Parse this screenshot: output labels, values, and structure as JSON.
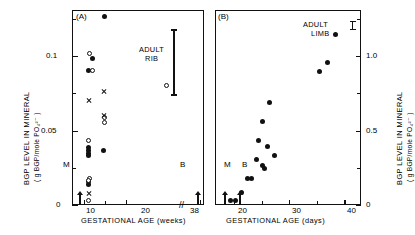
{
  "figure": {
    "panels": [
      {
        "id": "(A)",
        "xlabel": "GESTATIONAL  AGE  (weeks)",
        "ylabel_main": "BGP LEVEL IN MINERAL",
        "ylabel_units": "( g BGP/mole PO₄²⁻ )",
        "annotation": "ADULT\nRIB",
        "annotation_line1": "ADULT",
        "annotation_line2": "RIB",
        "marker_m": "M",
        "marker_b": "B",
        "xticklabels": [
          "10",
          "20",
          "38"
        ],
        "yticklabels": [
          "0",
          "0.05",
          "0.1"
        ],
        "axis_break": "//"
      },
      {
        "id": "(B)",
        "xlabel": "GESTATIONAL  AGE  (days)",
        "ylabel_main": "BGP LEVEL IN MINERAL",
        "ylabel_units": "( g BGP/mole PO₄²⁻ )",
        "annotation_line1": "ADULT",
        "annotation_line2": "LIMB",
        "marker_m": "M",
        "marker_b": "B",
        "xticklabels": [
          "20",
          "30",
          "40"
        ],
        "yticklabels": [
          "0",
          "0.5",
          "1.0"
        ]
      }
    ],
    "caption": ""
  },
  "chart_data": [
    {
      "type": "scatter",
      "panel": "(A)",
      "title": "(A)",
      "xlabel": "GESTATIONAL AGE (weeks)",
      "ylabel": "BGP LEVEL IN MINERAL (g BGP/mole PO4 2-)",
      "xlim": [
        7,
        39
      ],
      "ylim": [
        0,
        0.131
      ],
      "xticks": [
        10,
        20,
        38
      ],
      "yticks": [
        0,
        0.05,
        0.1
      ],
      "yminorticks": [
        0.025,
        0.075,
        0.125
      ],
      "grid": false,
      "legend": null,
      "axis_break_between": [
        22,
        36
      ],
      "series": [
        {
          "name": "filled-circle",
          "marker": "filled circle",
          "points": [
            {
              "x": 11.0,
              "y": 0.0905
            },
            {
              "x": 14.8,
              "y": 0.1265
            },
            {
              "x": 11.9,
              "y": 0.0985
            },
            {
              "x": 14.7,
              "y": 0.0365
            },
            {
              "x": 11.0,
              "y": 0.0385
            },
            {
              "x": 11.0,
              "y": 0.0365
            },
            {
              "x": 11.0,
              "y": 0.0345
            },
            {
              "x": 10.9,
              "y": 0.033
            },
            {
              "x": 11.0,
              "y": 0.0155
            },
            {
              "x": 11.1,
              "y": 0.014
            }
          ]
        },
        {
          "name": "open-circle",
          "marker": "open circle",
          "points": [
            {
              "x": 11.2,
              "y": 0.1015
            },
            {
              "x": 12.0,
              "y": 0.0905
            },
            {
              "x": 14.8,
              "y": 0.0585
            },
            {
              "x": 14.8,
              "y": 0.0555
            },
            {
              "x": 10.9,
              "y": 0.0435
            },
            {
              "x": 11.2,
              "y": 0.018
            },
            {
              "x": 11.0,
              "y": 0.0165
            },
            {
              "x": 11.0,
              "y": 0.003
            },
            {
              "x": 30.0,
              "y": 0.08
            }
          ]
        },
        {
          "name": "cross",
          "marker": "x",
          "points": [
            {
              "x": 11.0,
              "y": 0.07
            },
            {
              "x": 14.8,
              "y": 0.076
            },
            {
              "x": 14.8,
              "y": 0.06
            },
            {
              "x": 11.0,
              "y": 0.0075
            }
          ]
        }
      ],
      "range_bars": [
        {
          "label": "ADULT RIB",
          "x": 31.6,
          "ymin": 0.0735,
          "ymax": 0.118
        }
      ],
      "axis_arrows": [
        {
          "label": "M",
          "x": 8.6,
          "y": 0.0
        },
        {
          "label": "B",
          "x": 37.2,
          "y": 0.0
        }
      ]
    },
    {
      "type": "scatter",
      "panel": "(B)",
      "title": "(B)",
      "xlabel": "GESTATIONAL AGE (days)",
      "ylabel": "BGP LEVEL IN MINERAL (g BGP/mole PO4 2-)",
      "xlim": [
        16.5,
        43
      ],
      "ylim": [
        0,
        1.31
      ],
      "xticks": [
        20,
        30,
        40
      ],
      "yticks": [
        0,
        0.5,
        1.0
      ],
      "yminorticks": [
        0.25,
        0.75,
        1.25
      ],
      "grid": false,
      "legend": null,
      "series": [
        {
          "name": "filled-circle",
          "marker": "filled circle",
          "points": [
            {
              "x": 19.3,
              "y": 0.03
            },
            {
              "x": 20.2,
              "y": 0.03
            },
            {
              "x": 21.3,
              "y": 0.085
            },
            {
              "x": 22.4,
              "y": 0.175
            },
            {
              "x": 23.1,
              "y": 0.175
            },
            {
              "x": 24.0,
              "y": 0.305
            },
            {
              "x": 24.4,
              "y": 0.43
            },
            {
              "x": 25.2,
              "y": 0.56
            },
            {
              "x": 25.1,
              "y": 0.265
            },
            {
              "x": 25.4,
              "y": 0.245
            },
            {
              "x": 26.0,
              "y": 0.395
            },
            {
              "x": 26.4,
              "y": 0.69
            },
            {
              "x": 27.3,
              "y": 0.33
            },
            {
              "x": 35.4,
              "y": 0.9
            },
            {
              "x": 37.0,
              "y": 0.96
            },
            {
              "x": 38.4,
              "y": 1.145
            }
          ]
        }
      ],
      "annotations": [
        {
          "text": "ADULT LIMB",
          "x": 37.6,
          "y": 1.22
        }
      ],
      "range_bars": [
        {
          "label": "ADULT LIMB",
          "x": 41.4,
          "ymin": 1.175,
          "ymax": 1.235
        }
      ],
      "axis_arrows": [
        {
          "label": "M",
          "x": 18.1,
          "y": 0.0
        },
        {
          "label": "B",
          "x": 20.8,
          "y": 0.0
        }
      ]
    }
  ]
}
